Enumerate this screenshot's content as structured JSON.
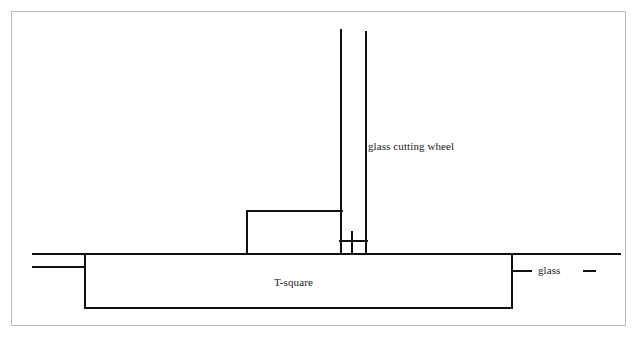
{
  "figure": {
    "background_color": "#ffffff",
    "line_color": "#000000",
    "border_color": "#b9b9b9",
    "width": 637,
    "height": 342
  },
  "labels": {
    "cutting_wheel": "glass cutting wheel",
    "tsquare": "T-square",
    "glass": "glass"
  },
  "parts": {
    "border": {
      "name": "figure-border",
      "x": 11,
      "y": 11,
      "width": 615,
      "height": 315
    },
    "glass_sheet": {
      "name": "glass-sheet",
      "top_line": {
        "x1": 33,
        "y1": 254,
        "x2": 620,
        "y2": 254
      },
      "stub_line": {
        "x1": 33,
        "y1": 267,
        "x2": 85,
        "y2": 267
      }
    },
    "tsquare_body": {
      "name": "tsquare-body",
      "left": 85,
      "right": 512,
      "top": 254,
      "bottom": 308
    },
    "tsquare_step": {
      "name": "tsquare-step-block",
      "left": 247,
      "right": 341,
      "top": 211,
      "bottom": 254
    },
    "cutting_wheel": {
      "name": "cutting-wheel-assembly",
      "shaft_left": {
        "x": 341,
        "y_top": 30,
        "y_bottom": 254
      },
      "shaft_right": {
        "x": 366,
        "y_top": 32,
        "y_bottom": 254
      },
      "inner_post": {
        "x": 352,
        "y_top": 232,
        "y_bottom": 254
      },
      "crossbar": {
        "x1": 341,
        "y": 241,
        "x2": 366
      }
    },
    "glass_leader": {
      "name": "glass-leader",
      "edge_tick": {
        "x": 512,
        "y_top": 254,
        "y_bottom": 285
      },
      "arm": {
        "x1": 512,
        "y": 271,
        "x2": 530
      },
      "dash": {
        "x1": 584,
        "y": 271,
        "x2": 594
      }
    }
  }
}
